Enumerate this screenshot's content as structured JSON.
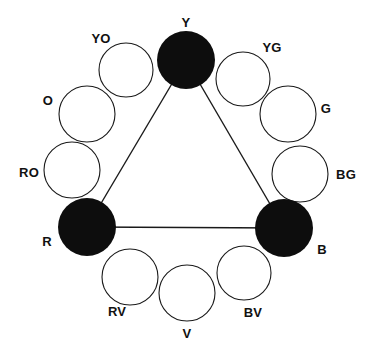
{
  "diagram": {
    "type": "color-wheel",
    "background_color": "#ffffff",
    "stroke_color": "#1a1a1a",
    "fill_primary": "#0d0d0d",
    "fill_secondary": "#ffffff",
    "label_color": "#111111",
    "wheel_center": {
      "x": 187,
      "y": 172
    },
    "wheel_radius": 130,
    "swatch_radius": 28,
    "triad": {
      "name": "primary-triad",
      "vertices": [
        "Y",
        "R",
        "B"
      ],
      "edges": [
        {
          "from": "Y",
          "to": "R"
        },
        {
          "from": "Y",
          "to": "B"
        },
        {
          "from": "R",
          "to": "B"
        }
      ],
      "line_width": 1.4
    },
    "nodes": [
      {
        "id": "Y",
        "label": "Y",
        "name": "yellow",
        "filled": true,
        "cx": 186,
        "cy": 60,
        "r": 29,
        "label_x": 186,
        "label_y": 22
      },
      {
        "id": "YG",
        "label": "YG",
        "name": "yellow-green",
        "filled": false,
        "cx": 243,
        "cy": 79,
        "r": 27,
        "label_x": 272,
        "label_y": 47
      },
      {
        "id": "G",
        "label": "G",
        "name": "green",
        "filled": false,
        "cx": 288,
        "cy": 114,
        "r": 28,
        "label_x": 326,
        "label_y": 108
      },
      {
        "id": "BG",
        "label": "BG",
        "name": "blue-green",
        "filled": false,
        "cx": 300,
        "cy": 174,
        "r": 28,
        "label_x": 346,
        "label_y": 174
      },
      {
        "id": "B",
        "label": "B",
        "name": "blue",
        "filled": true,
        "cx": 284,
        "cy": 228,
        "r": 29,
        "label_x": 322,
        "label_y": 249
      },
      {
        "id": "BV",
        "label": "BV",
        "name": "blue-violet",
        "filled": false,
        "cx": 244,
        "cy": 273,
        "r": 27,
        "label_x": 253,
        "label_y": 312
      },
      {
        "id": "V",
        "label": "V",
        "name": "violet",
        "filled": false,
        "cx": 187,
        "cy": 293,
        "r": 28,
        "label_x": 187,
        "label_y": 333
      },
      {
        "id": "RV",
        "label": "RV",
        "name": "red-violet",
        "filled": false,
        "cx": 130,
        "cy": 277,
        "r": 28,
        "label_x": 117,
        "label_y": 311
      },
      {
        "id": "R",
        "label": "R",
        "name": "red",
        "filled": true,
        "cx": 87,
        "cy": 227,
        "r": 29,
        "label_x": 47,
        "label_y": 241
      },
      {
        "id": "RO",
        "label": "RO",
        "name": "red-orange",
        "filled": false,
        "cx": 72,
        "cy": 170,
        "r": 28,
        "label_x": 29,
        "label_y": 172
      },
      {
        "id": "O",
        "label": "O",
        "name": "orange",
        "filled": false,
        "cx": 87,
        "cy": 114,
        "r": 28,
        "label_x": 48,
        "label_y": 100
      },
      {
        "id": "YO",
        "label": "YO",
        "name": "yellow-orange",
        "filled": false,
        "cx": 126,
        "cy": 70,
        "r": 27,
        "label_x": 101,
        "label_y": 38
      }
    ]
  }
}
